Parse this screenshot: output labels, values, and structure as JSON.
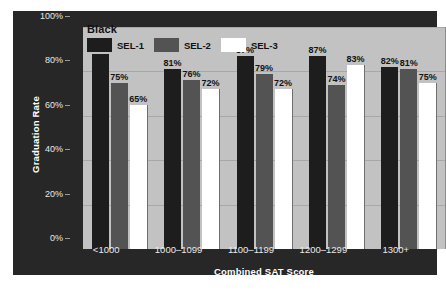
{
  "chart_data": {
    "type": "bar",
    "title": "Black",
    "xlabel": "Combined SAT Score",
    "ylabel": "Graduation Rate",
    "categories": [
      "<1000",
      "1000–1099",
      "1100–1199",
      "1200–1299",
      "1300+"
    ],
    "series": [
      {
        "name": "SEL-1",
        "color": "#1d1d1d",
        "values": [
          88,
          81,
          87,
          87,
          82
        ],
        "labels": [
          "88%",
          "81%",
          "87%",
          "87%",
          "82%"
        ]
      },
      {
        "name": "SEL-2",
        "color": "#535353",
        "values": [
          75,
          76,
          79,
          74,
          81
        ],
        "labels": [
          "75%",
          "76%",
          "79%",
          "74%",
          "81%"
        ]
      },
      {
        "name": "SEL-3",
        "color": "#ffffff",
        "values": [
          65,
          72,
          72,
          83,
          75
        ],
        "labels": [
          "65%",
          "72%",
          "72%",
          "83%",
          "75%"
        ]
      }
    ],
    "ylim": [
      0,
      100
    ],
    "yticks": [
      0,
      20,
      40,
      60,
      80,
      100
    ],
    "ytick_labels": [
      "0%",
      "20%",
      "40%",
      "60%",
      "80%",
      "100%"
    ],
    "grid": true,
    "legend_position": "top-left",
    "plot_background": "#c2c2c2",
    "panel_background": "#272727"
  }
}
